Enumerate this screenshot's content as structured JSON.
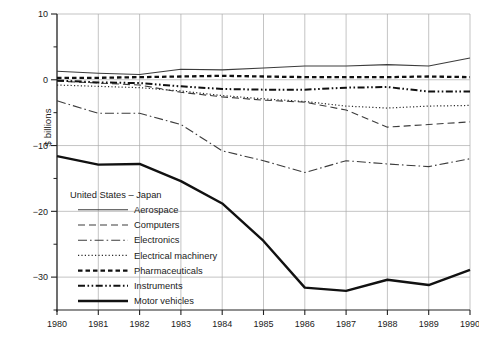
{
  "chart_data": {
    "type": "line",
    "title": "",
    "subtitle": "",
    "xlabel": "",
    "ylabel": "$ billions",
    "legend_title": "United States – Japan",
    "legend_position": "inside-lower-left",
    "grid": true,
    "x": [
      1980,
      1981,
      1982,
      1983,
      1984,
      1985,
      1986,
      1987,
      1988,
      1989,
      1990
    ],
    "categories": [
      "1980",
      "1981",
      "1982",
      "1983",
      "1984",
      "1985",
      "1986",
      "1987",
      "1988",
      "1989",
      "1990"
    ],
    "xlim": [
      1980,
      1990
    ],
    "ylim": [
      -35,
      10
    ],
    "ytick_labels": [
      "10",
      "0",
      "−10",
      "−20",
      "−30"
    ],
    "ytick_values": [
      10,
      0,
      -10,
      -20,
      -30
    ],
    "yminor_values": [
      5,
      -5,
      -15,
      -25,
      -35
    ],
    "series": [
      {
        "name": "Aerospace",
        "style": "solid",
        "color": "#3c3c3c",
        "width": 1.1,
        "values": [
          1.3,
          1.0,
          0.8,
          1.6,
          1.5,
          1.8,
          2.1,
          2.1,
          2.3,
          2.1,
          3.3
        ]
      },
      {
        "name": "Computers",
        "style": "dashed",
        "color": "#3c3c3c",
        "width": 1.1,
        "values": [
          -0.2,
          -0.5,
          -0.8,
          -1.9,
          -2.6,
          -3.1,
          -3.4,
          -4.6,
          -7.2,
          -6.8,
          -6.4
        ]
      },
      {
        "name": "Electronics",
        "style": "dash-dot",
        "color": "#3c3c3c",
        "width": 1.1,
        "values": [
          -3.2,
          -5.1,
          -5.1,
          -6.8,
          -10.8,
          -12.3,
          -14.1,
          -12.3,
          -12.8,
          -13.2,
          -12.0
        ]
      },
      {
        "name": "Electrical machinery",
        "style": "dotted",
        "color": "#2b2b2b",
        "width": 1.2,
        "values": [
          -0.8,
          -1.0,
          -1.2,
          -1.7,
          -2.4,
          -2.9,
          -3.3,
          -4.0,
          -4.3,
          -4.0,
          -3.9
        ]
      },
      {
        "name": "Pharmaceuticals",
        "style": "thick-dashed",
        "color": "#111111",
        "width": 2.3,
        "values": [
          0.3,
          0.3,
          0.4,
          0.5,
          0.6,
          0.5,
          0.4,
          0.4,
          0.4,
          0.5,
          0.4
        ]
      },
      {
        "name": "Instruments",
        "style": "dash-dot-dot",
        "color": "#111111",
        "width": 2.0,
        "values": [
          -0.1,
          -0.4,
          -0.5,
          -1.0,
          -1.4,
          -1.5,
          -1.5,
          -1.2,
          -1.1,
          -1.8,
          -1.8
        ]
      },
      {
        "name": "Motor vehicles",
        "style": "thick-solid",
        "color": "#111111",
        "width": 2.4,
        "values": [
          -11.6,
          -12.9,
          -12.8,
          -15.4,
          -18.8,
          -24.5,
          -31.6,
          -32.1,
          -30.4,
          -31.2,
          -28.9
        ]
      }
    ]
  }
}
